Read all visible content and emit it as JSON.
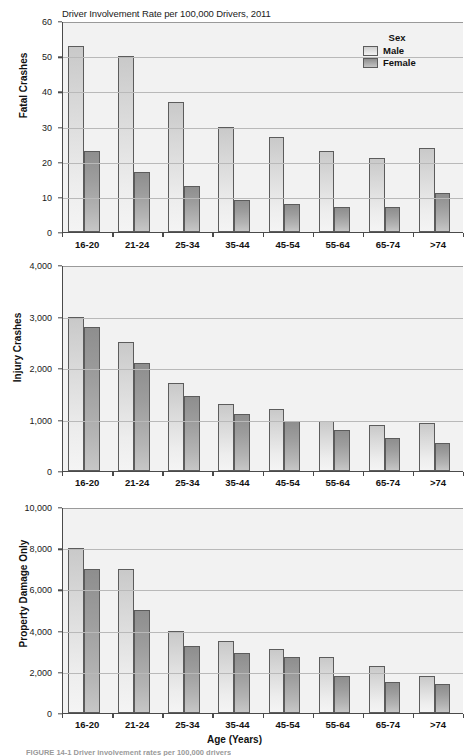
{
  "figure": {
    "supertitle": "Driver Involvement Rate per 100,000 Drivers, 2011",
    "xaxis_title": "Age (Years)",
    "caption": "FIGURE 14-1   Driver involvement rates per 100,000 drivers",
    "legend": {
      "title": "Sex",
      "entries": [
        {
          "label": "Male",
          "color": "#e3e3e3",
          "key": "male"
        },
        {
          "label": "Female",
          "color": "#a8a8a8",
          "key": "female"
        }
      ]
    }
  },
  "chart_data": [
    {
      "type": "bar",
      "title": "Driver Involvement Rate per 100,000 Drivers, 2011",
      "ylabel": "Fatal Crashes",
      "xlabel": "Age (Years)",
      "categories": [
        "16-20",
        "21-24",
        "25-34",
        "35-44",
        "45-54",
        "55-64",
        "65-74",
        ">74"
      ],
      "yticks": [
        "0",
        "10",
        "20",
        "30",
        "40",
        "50",
        "60"
      ],
      "ytick_values": [
        0,
        10,
        20,
        30,
        40,
        50,
        60
      ],
      "ylim": [
        0,
        60
      ],
      "grid": true,
      "legend_position": "top-right",
      "series": [
        {
          "name": "Male",
          "values": [
            53,
            50,
            37,
            30,
            27,
            23,
            21,
            24
          ]
        },
        {
          "name": "Female",
          "values": [
            23,
            17,
            13,
            9,
            8,
            7,
            7,
            11
          ]
        }
      ]
    },
    {
      "type": "bar",
      "title": "",
      "ylabel": "Injury Crashes",
      "xlabel": "Age (Years)",
      "categories": [
        "16-20",
        "21-24",
        "25-34",
        "35-44",
        "45-54",
        "55-64",
        "65-74",
        ">74"
      ],
      "yticks": [
        "0",
        "1,000",
        "2,000",
        "3,000",
        "4,000"
      ],
      "ytick_values": [
        0,
        1000,
        2000,
        3000,
        4000
      ],
      "ylim": [
        0,
        4000
      ],
      "grid": true,
      "series": [
        {
          "name": "Male",
          "values": [
            3000,
            2500,
            1700,
            1300,
            1200,
            980,
            900,
            930
          ]
        },
        {
          "name": "Female",
          "values": [
            2800,
            2100,
            1450,
            1100,
            980,
            800,
            650,
            550
          ]
        }
      ]
    },
    {
      "type": "bar",
      "title": "",
      "ylabel": "Property Damage Only",
      "xlabel": "Age (Years)",
      "categories": [
        "16-20",
        "21-24",
        "25-34",
        "35-44",
        "45-54",
        "55-64",
        "65-74",
        ">74"
      ],
      "yticks": [
        "0",
        "2,000",
        "4,000",
        "6,000",
        "8,000",
        "10,000"
      ],
      "ytick_values": [
        0,
        2000,
        4000,
        6000,
        8000,
        10000
      ],
      "ylim": [
        0,
        10000
      ],
      "grid": true,
      "series": [
        {
          "name": "Male",
          "values": [
            8000,
            7000,
            4000,
            3500,
            3100,
            2700,
            2300,
            1800
          ]
        },
        {
          "name": "Female",
          "values": [
            7000,
            5000,
            3250,
            2900,
            2700,
            1800,
            1500,
            1400
          ]
        }
      ]
    }
  ]
}
